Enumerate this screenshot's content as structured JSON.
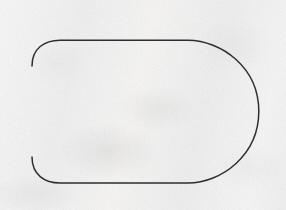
{
  "figure": {
    "media": "scanned-paper-diagram",
    "width": 286,
    "height": 210,
    "background_color": "#f2f1f0",
    "paper_tone": "off-white mottled scan"
  },
  "axes": {
    "vertical": {
      "label": "vertical-axis",
      "x": 32,
      "y_start": 14,
      "y_end": 192,
      "color": "#7d7d7d",
      "stroke_width": 1.1
    },
    "horizontal": {
      "label": "horizontal-axis",
      "y": 111,
      "x_start": 15,
      "x_end": 270,
      "color": "#8e8e8e",
      "stroke_width": 1.1
    },
    "origin": {
      "x": 32,
      "y": 111
    }
  },
  "curve": {
    "label": "d-shaped-closed-curve",
    "color": "#2f2f2f",
    "stroke_width": 1.5,
    "fill": "none",
    "geometry": {
      "left_x": 32,
      "top_y": 40,
      "bottom_y": 183,
      "right_x": 259,
      "corner_radius": 26,
      "straight_top_from_x": 58,
      "straight_top_to_x": 197,
      "straight_bottom_from_x": 58,
      "straight_bottom_to_x": 197,
      "arc_center_x": 197,
      "arc_center_y": 111,
      "arc_radius_x": 62,
      "arc_radius_y": 72
    },
    "path": "M 32 66 C 32 48 44 40 60 40 L 190 40 C 222 40 259 66 259 111 C 259 156 222 183 190 183 L 60 183 C 44 183 32 175 32 157 Z"
  },
  "annotations": {
    "tick_labels": [],
    "text_labels": [],
    "legend": []
  }
}
